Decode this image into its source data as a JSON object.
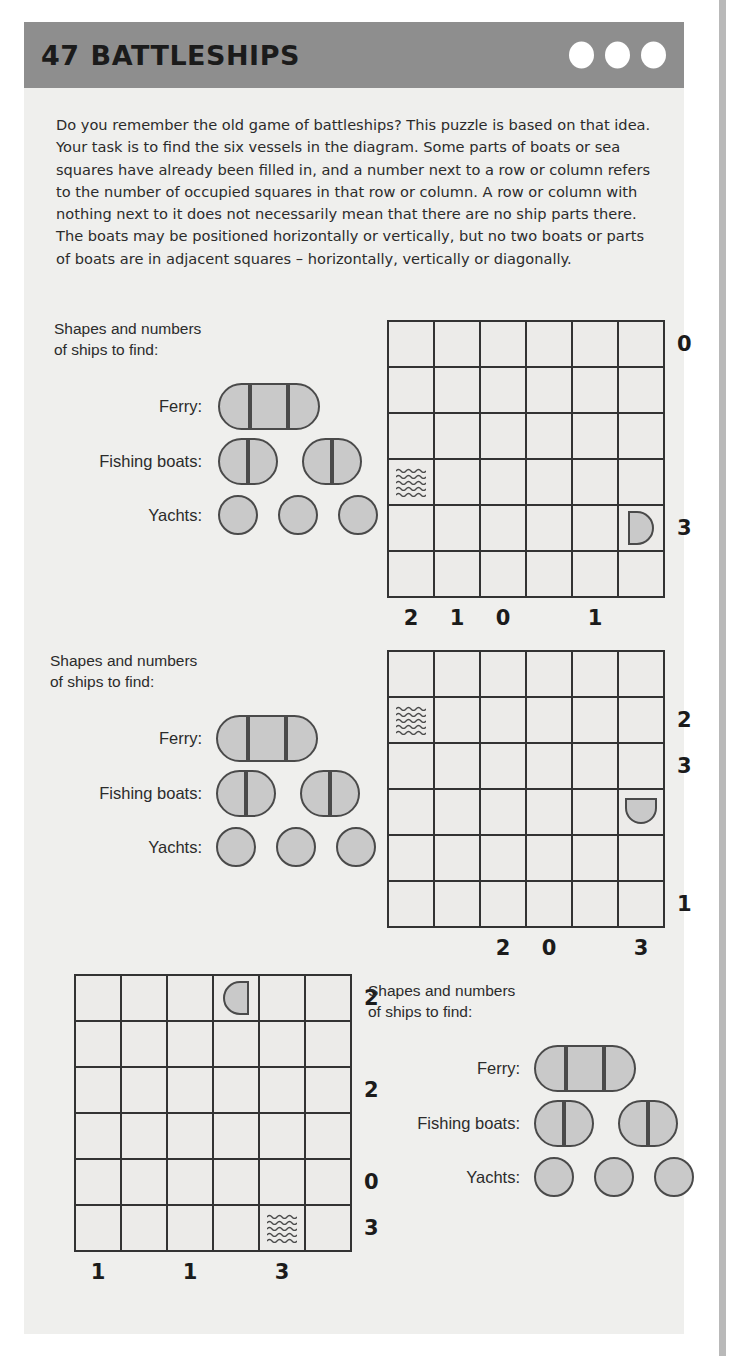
{
  "header": {
    "number": "47",
    "title": "BATTLESHIPS",
    "difficulty_dots": 3,
    "band_color": "#8e8e8e",
    "dot_color": "#ffffff"
  },
  "intro": {
    "text": "Do you remember the old game of battleships? This puzzle is based on that idea. Your task is to find the six vessels in the diagram. Some parts of boats or  sea squares have already been filled in, and a number next to a row or column refers to the number of occupied squares in that row or column. A row or column with nothing next to it does not necessarily mean that there are no ship parts there. The boats may be positioned horizontally or vertically, but no two boats or parts of boats are in adjacent squares – horizontally, vertically or diagonally."
  },
  "legend": {
    "title": "Shapes and numbers\nof ships to find:",
    "ferry_label": "Ferry:",
    "fishing_label": "Fishing boats:",
    "yachts_label": "Yachts:",
    "ferry_count": 1,
    "fishing_count": 2,
    "yacht_count": 3,
    "fill_color": "#c9c9c9",
    "stroke_color": "#4a4a4a"
  },
  "puzzles": [
    {
      "id": "puzzle-1",
      "grid_size": 6,
      "row_clues": [
        "0",
        "",
        "",
        "",
        "3",
        ""
      ],
      "col_clues": [
        "2",
        "1",
        "0",
        "",
        "1",
        ""
      ],
      "cells": [
        {
          "row": 4,
          "col": 1,
          "type": "water"
        },
        {
          "row": 5,
          "col": 6,
          "type": "half-right"
        }
      ]
    },
    {
      "id": "puzzle-2",
      "grid_size": 6,
      "row_clues": [
        "",
        "2",
        "3",
        "",
        "",
        "1"
      ],
      "col_clues": [
        "",
        "",
        "2",
        "0",
        "",
        "3"
      ],
      "cells": [
        {
          "row": 2,
          "col": 1,
          "type": "water"
        },
        {
          "row": 4,
          "col": 6,
          "type": "half-bottom"
        }
      ]
    },
    {
      "id": "puzzle-3",
      "grid_size": 6,
      "row_clues": [
        "2",
        "",
        "2",
        "",
        "0",
        "3"
      ],
      "col_clues": [
        "1",
        "",
        "1",
        "",
        "3",
        ""
      ],
      "cells": [
        {
          "row": 1,
          "col": 4,
          "type": "half-left"
        },
        {
          "row": 6,
          "col": 5,
          "type": "water"
        }
      ]
    }
  ]
}
